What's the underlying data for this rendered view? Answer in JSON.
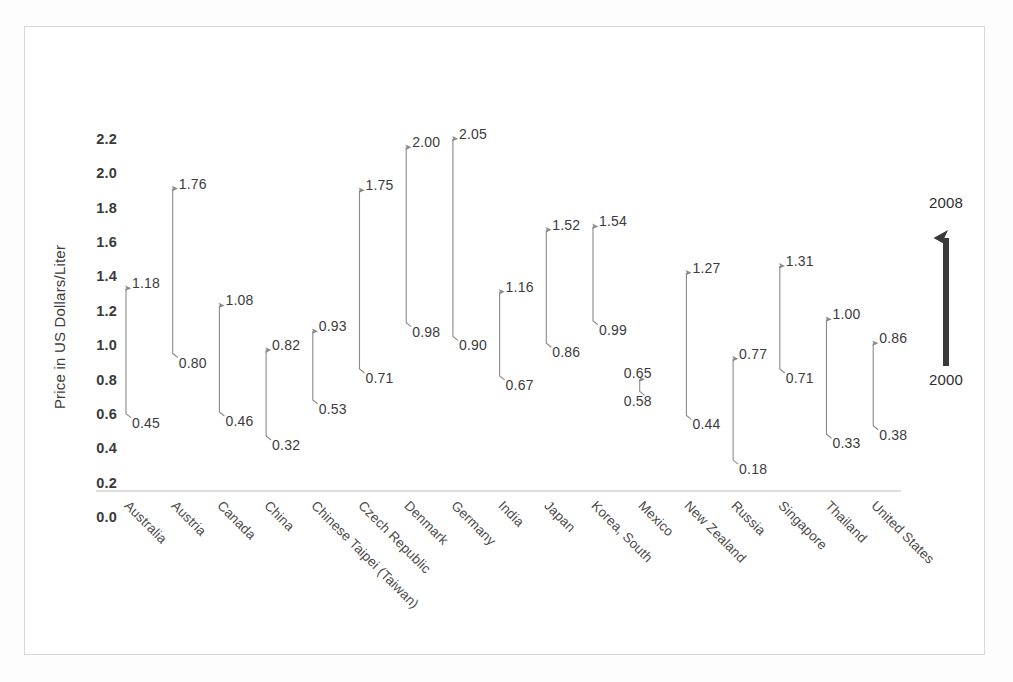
{
  "chart_data": {
    "type": "arrow-range",
    "title": "",
    "xlabel": "",
    "ylabel": "Price in US Dollars/Liter",
    "ylim": [
      0.0,
      2.2
    ],
    "ytick_labels": [
      "0.0",
      "0.2",
      "0.4",
      "0.6",
      "0.8",
      "1.0",
      "1.2",
      "1.4",
      "1.6",
      "1.8",
      "2.0",
      "2.2"
    ],
    "ytick_values": [
      0.0,
      0.2,
      0.4,
      0.6,
      0.8,
      1.0,
      1.2,
      1.4,
      1.6,
      1.8,
      2.0,
      2.2
    ],
    "grid": false,
    "legend_position": "right",
    "series": [
      {
        "name": "2000",
        "role": "arrow-tail"
      },
      {
        "name": "2008",
        "role": "arrow-head"
      }
    ],
    "categories": [
      "Australia",
      "Austria",
      "Canada",
      "China",
      "Chinese Taipei (Taiwan)",
      "Czech Republic",
      "Denmark",
      "Germany",
      "India",
      "Japan",
      "Korea, South",
      "Mexico",
      "New Zealand",
      "Russia",
      "Singapore",
      "Thailand",
      "United States"
    ],
    "values_2000": [
      0.45,
      0.8,
      0.46,
      0.32,
      0.53,
      0.71,
      0.98,
      0.9,
      0.67,
      0.86,
      0.99,
      0.58,
      0.44,
      0.18,
      0.71,
      0.33,
      0.38
    ],
    "values_2008": [
      1.18,
      1.76,
      1.08,
      0.82,
      0.93,
      1.75,
      2.0,
      2.05,
      1.16,
      1.52,
      1.54,
      0.65,
      1.27,
      0.77,
      1.31,
      1.0,
      0.86
    ],
    "labels_2000": [
      "0.45",
      "0.80",
      "0.46",
      "0.32",
      "0.53",
      "0.71",
      "0.98",
      "0.90",
      "0.67",
      "0.86",
      "0.99",
      "0.58",
      "0.44",
      "0.18",
      "0.71",
      "0.33",
      "0.38"
    ],
    "labels_2008": [
      "1.18",
      "1.76",
      "1.08",
      "0.82",
      "0.93",
      "1.75",
      "2.00",
      "2.05",
      "1.16",
      "1.52",
      "1.54",
      "0.65",
      "1.27",
      "0.77",
      "1.31",
      "1.00",
      "0.86"
    ],
    "arrow_color": "#8a8a8a",
    "axis_color": "#d4d4d4",
    "text_color": "#3c3c3c"
  },
  "legend": {
    "top_label": "2008",
    "bottom_label": "2000",
    "color": "#3a3a3a"
  }
}
